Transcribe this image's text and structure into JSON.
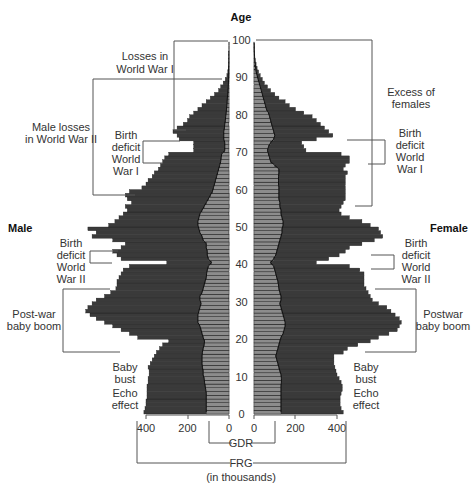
{
  "chart_data": {
    "type": "bar",
    "subtype": "population-pyramid",
    "title": "",
    "xlabel": "FRG (in thousands)",
    "ylabel": "Age",
    "y_axis_ticks": [
      0,
      10,
      20,
      30,
      40,
      50,
      60,
      70,
      80,
      90,
      100
    ],
    "x_axis_ticks_left": [
      400,
      200,
      0
    ],
    "x_axis_ticks_right": [
      0,
      200,
      400
    ],
    "xlim": [
      0,
      700
    ],
    "ylim": [
      0,
      100
    ],
    "grid": false,
    "sides": {
      "left": "Male",
      "right": "Female"
    },
    "legend": [
      {
        "name": "FRG",
        "note": "outer (dark) bars, measured from axis",
        "color": "#3a3a3a"
      },
      {
        "name": "GDR",
        "note": "inner (light) portion adjacent to axis",
        "color": "#8a8a8a"
      }
    ],
    "ages": [
      0,
      1,
      2,
      3,
      4,
      5,
      6,
      7,
      8,
      9,
      10,
      11,
      12,
      13,
      14,
      15,
      16,
      17,
      18,
      19,
      20,
      21,
      22,
      23,
      24,
      25,
      26,
      27,
      28,
      29,
      30,
      31,
      32,
      33,
      34,
      35,
      36,
      37,
      38,
      39,
      40,
      41,
      42,
      43,
      44,
      45,
      46,
      47,
      48,
      49,
      50,
      51,
      52,
      53,
      54,
      55,
      56,
      57,
      58,
      59,
      60,
      61,
      62,
      63,
      64,
      65,
      66,
      67,
      68,
      69,
      70,
      71,
      72,
      73,
      74,
      75,
      76,
      77,
      78,
      79,
      80,
      81,
      82,
      83,
      84,
      85,
      86,
      87,
      88,
      89,
      90,
      91,
      92,
      93,
      94,
      95,
      96,
      97,
      98,
      99
    ],
    "series": [
      {
        "name": "Male FRG+GDR total",
        "values": [
          410,
          405,
          400,
          400,
          395,
          395,
          395,
          395,
          390,
          390,
          385,
          385,
          390,
          380,
          370,
          360,
          350,
          335,
          320,
          290,
          440,
          480,
          520,
          560,
          600,
          640,
          670,
          690,
          680,
          660,
          640,
          600,
          570,
          545,
          540,
          540,
          530,
          520,
          510,
          480,
          300,
          520,
          540,
          560,
          520,
          500,
          560,
          660,
          640,
          680,
          580,
          550,
          530,
          510,
          490,
          500,
          470,
          490,
          500,
          480,
          420,
          400,
          390,
          370,
          360,
          340,
          330,
          320,
          310,
          290,
          170,
          170,
          170,
          240,
          250,
          270,
          250,
          220,
          200,
          190,
          170,
          150,
          130,
          110,
          90,
          70,
          50,
          40,
          28,
          18,
          10,
          6,
          4,
          3,
          2,
          1,
          1,
          0,
          0,
          0
        ]
      },
      {
        "name": "Male GDR",
        "values": [
          110,
          110,
          110,
          110,
          110,
          110,
          112,
          115,
          118,
          120,
          125,
          125,
          128,
          130,
          130,
          130,
          128,
          125,
          120,
          118,
          125,
          130,
          135,
          140,
          150,
          150,
          150,
          145,
          140,
          135,
          140,
          140,
          130,
          125,
          120,
          115,
          110,
          108,
          105,
          100,
          85,
          100,
          105,
          105,
          110,
          110,
          125,
          130,
          140,
          145,
          150,
          150,
          145,
          140,
          130,
          120,
          110,
          100,
          90,
          80,
          75,
          70,
          65,
          60,
          55,
          50,
          45,
          40,
          38,
          35,
          20,
          20,
          20,
          25,
          25,
          25,
          22,
          20,
          18,
          16,
          14,
          12,
          10,
          9,
          8,
          6,
          5,
          4,
          3,
          2,
          1,
          1,
          1,
          0,
          0,
          0,
          0,
          0,
          0,
          0
        ]
      },
      {
        "name": "Female FRG+GDR total",
        "values": [
          430,
          420,
          415,
          415,
          415,
          420,
          425,
          425,
          420,
          410,
          400,
          395,
          390,
          385,
          385,
          385,
          430,
          450,
          500,
          560,
          600,
          650,
          690,
          700,
          710,
          700,
          680,
          660,
          640,
          600,
          570,
          560,
          550,
          540,
          530,
          530,
          530,
          530,
          510,
          460,
          300,
          360,
          410,
          440,
          460,
          520,
          580,
          620,
          610,
          600,
          560,
          520,
          460,
          420,
          410,
          420,
          430,
          440,
          440,
          440,
          440,
          440,
          440,
          440,
          450,
          430,
          440,
          460,
          460,
          420,
          250,
          240,
          230,
          300,
          380,
          360,
          340,
          320,
          300,
          280,
          240,
          200,
          170,
          150,
          120,
          100,
          80,
          65,
          50,
          40,
          30,
          22,
          15,
          10,
          6,
          4,
          2,
          1,
          1,
          0
        ]
      },
      {
        "name": "Female GDR",
        "values": [
          130,
          130,
          130,
          130,
          130,
          130,
          130,
          130,
          132,
          132,
          130,
          125,
          120,
          115,
          110,
          105,
          110,
          115,
          120,
          125,
          130,
          140,
          145,
          150,
          150,
          145,
          140,
          135,
          130,
          125,
          130,
          130,
          125,
          120,
          118,
          115,
          110,
          105,
          100,
          95,
          80,
          95,
          105,
          110,
          115,
          120,
          125,
          130,
          135,
          135,
          140,
          140,
          135,
          130,
          130,
          125,
          125,
          120,
          120,
          120,
          120,
          118,
          118,
          118,
          120,
          120,
          100,
          80,
          75,
          70,
          65,
          70,
          80,
          95,
          100,
          95,
          90,
          85,
          80,
          75,
          70,
          60,
          55,
          50,
          45,
          40,
          35,
          30,
          25,
          20,
          15,
          10,
          8,
          6,
          4,
          3,
          2,
          1,
          1,
          0
        ]
      }
    ],
    "annotations": [
      {
        "side": "left",
        "text": "Losses in World War I",
        "age_range": [
          73,
          100
        ]
      },
      {
        "side": "left",
        "text": "Male losses in World War II",
        "age_range": [
          58,
          90
        ]
      },
      {
        "side": "left",
        "text": "Birth deficit World War I",
        "age_range": [
          66,
          72
        ]
      },
      {
        "side": "left",
        "text": "Birth deficit World War II",
        "age_range": [
          40,
          44
        ]
      },
      {
        "side": "left",
        "text": "Post-war baby boom",
        "age_range": [
          17,
          33
        ]
      },
      {
        "side": "left",
        "text": "Baby bust",
        "age_range": [
          10,
          15
        ]
      },
      {
        "side": "left",
        "text": "Echo effect",
        "age_range": [
          0,
          8
        ]
      },
      {
        "side": "right",
        "text": "Excess of females",
        "age_range": [
          58,
          100
        ]
      },
      {
        "side": "right",
        "text": "Birth deficit World War I",
        "age_range": [
          66,
          72
        ]
      },
      {
        "side": "right",
        "text": "Birth deficit World War II",
        "age_range": [
          40,
          44
        ]
      },
      {
        "side": "right",
        "text": "Postwar baby boom",
        "age_range": [
          17,
          33
        ]
      },
      {
        "side": "right",
        "text": "Baby bust",
        "age_range": [
          10,
          15
        ]
      },
      {
        "side": "right",
        "text": "Echo effect",
        "age_range": [
          0,
          8
        ]
      }
    ]
  },
  "labels": {
    "age_title": "Age",
    "male": "Male",
    "female": "Female",
    "gdr": "GDR",
    "frg": "FRG",
    "units": "(in thousands)",
    "gdr_zero": "0",
    "left": {
      "losses_ww1": [
        "Losses in",
        "World War I"
      ],
      "male_losses_ww2": [
        "Male losses",
        "in World War II"
      ],
      "birth_deficit_ww1": [
        "Birth",
        "deficit",
        "World",
        "War I"
      ],
      "birth_deficit_ww2": [
        "Birth",
        "deficit",
        "World",
        "War II"
      ],
      "baby_boom": [
        "Post-war",
        "baby boom"
      ],
      "baby_bust": [
        "Baby",
        "bust"
      ],
      "echo": [
        "Echo",
        "effect"
      ]
    },
    "right": {
      "excess_females": [
        "Excess of",
        "females"
      ],
      "birth_deficit_ww1": [
        "Birth",
        "deficit",
        "World",
        "War I"
      ],
      "birth_deficit_ww2": [
        "Birth",
        "deficit",
        "World",
        "War II"
      ],
      "baby_boom": [
        "Postwar",
        "baby boom"
      ],
      "baby_bust": [
        "Baby",
        "bust"
      ],
      "echo": [
        "Echo",
        "effect"
      ]
    }
  },
  "colors": {
    "frg_bar": "#3a3a3a",
    "gdr_bar": "#8c8c8c",
    "bar_line": "#1a1a1a",
    "bracket": "#555555",
    "text": "#333333"
  }
}
